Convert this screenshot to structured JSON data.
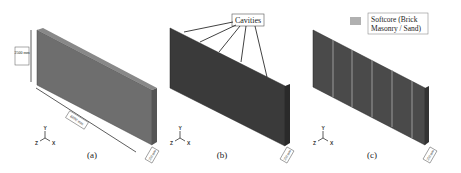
{
  "panels": [
    {
      "id": "a",
      "caption": "(a)",
      "dimensions": {
        "height": "2500 mm",
        "length": "6000 mm",
        "thickness": "250 mm"
      },
      "fill": "#6e6e6e"
    },
    {
      "id": "b",
      "caption": "(b)",
      "callout": "Cavities",
      "cavity_count": 5,
      "thickness": "250 mm",
      "fill": "#3a3a3a"
    },
    {
      "id": "c",
      "caption": "(c)",
      "legend": {
        "label_line1": "Softcore (Brick",
        "label_line2": "Masonry / Sand)",
        "swatch": "#b0b0b0"
      },
      "thickness": "250 mm",
      "fill": "#4a4a4a"
    }
  ],
  "axes": {
    "y": "Y",
    "z": "Z",
    "x": "X"
  }
}
